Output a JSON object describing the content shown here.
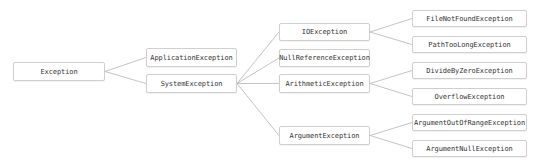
{
  "diagram": {
    "title": "",
    "type": "tree",
    "colors": {
      "background": "#ffffff",
      "node_border": "#cfcfcf",
      "node_fill": "#ffffff",
      "text": "#333333",
      "edge": "#b5b5b5"
    },
    "nodes": [
      {
        "id": "exception",
        "label": "Exception",
        "x": 13,
        "y": 62,
        "w": 92,
        "h": 19
      },
      {
        "id": "application-exception",
        "label": "ApplicationException",
        "x": 146,
        "y": 48,
        "w": 91,
        "h": 19
      },
      {
        "id": "system-exception",
        "label": "SystemException",
        "x": 146,
        "y": 74,
        "w": 91,
        "h": 19
      },
      {
        "id": "io-exception",
        "label": "IOException",
        "x": 279,
        "y": 23,
        "w": 91,
        "h": 18
      },
      {
        "id": "null-reference-exception",
        "label": "NullReferenceException",
        "x": 279,
        "y": 49,
        "w": 91,
        "h": 18
      },
      {
        "id": "arithmetic-exception",
        "label": "ArithmeticException",
        "x": 279,
        "y": 74,
        "w": 91,
        "h": 19
      },
      {
        "id": "argument-exception",
        "label": "ArgumentException",
        "x": 279,
        "y": 126,
        "w": 91,
        "h": 19
      },
      {
        "id": "file-not-found-exception",
        "label": "FileNotFoundException",
        "x": 412,
        "y": 10,
        "w": 115,
        "h": 17
      },
      {
        "id": "path-too-long-exception",
        "label": "PathTooLongException",
        "x": 412,
        "y": 36,
        "w": 115,
        "h": 17
      },
      {
        "id": "divide-by-zero-exception",
        "label": "DivideByZeroException",
        "x": 412,
        "y": 62,
        "w": 115,
        "h": 17
      },
      {
        "id": "overflow-exception",
        "label": "OverflowException",
        "x": 412,
        "y": 88,
        "w": 115,
        "h": 17
      },
      {
        "id": "argument-out-of-range-exception",
        "label": "ArgumentOutOfRangeException",
        "x": 412,
        "y": 114,
        "w": 115,
        "h": 17
      },
      {
        "id": "argument-null-exception",
        "label": "ArgumentNullException",
        "x": 412,
        "y": 140,
        "w": 115,
        "h": 17
      }
    ],
    "edges": [
      {
        "from": "exception",
        "to": "application-exception"
      },
      {
        "from": "exception",
        "to": "system-exception"
      },
      {
        "from": "system-exception",
        "to": "io-exception"
      },
      {
        "from": "system-exception",
        "to": "null-reference-exception"
      },
      {
        "from": "system-exception",
        "to": "arithmetic-exception"
      },
      {
        "from": "system-exception",
        "to": "argument-exception"
      },
      {
        "from": "io-exception",
        "to": "file-not-found-exception"
      },
      {
        "from": "io-exception",
        "to": "path-too-long-exception"
      },
      {
        "from": "arithmetic-exception",
        "to": "divide-by-zero-exception"
      },
      {
        "from": "arithmetic-exception",
        "to": "overflow-exception"
      },
      {
        "from": "argument-exception",
        "to": "argument-out-of-range-exception"
      },
      {
        "from": "argument-exception",
        "to": "argument-null-exception"
      }
    ]
  }
}
